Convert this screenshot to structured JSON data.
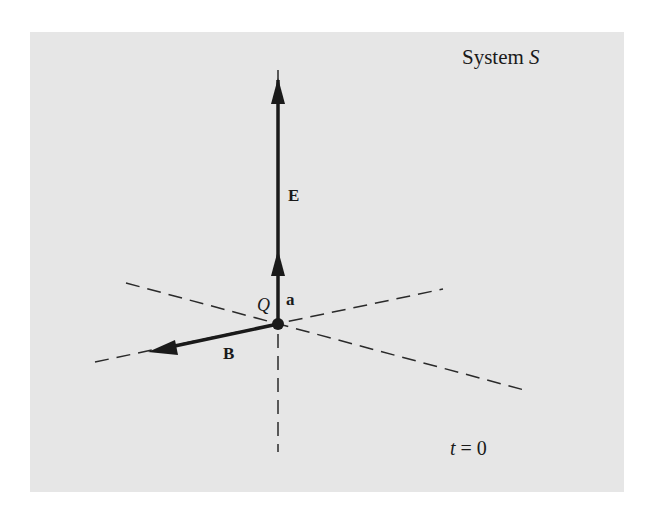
{
  "figure": {
    "title_prefix": "System",
    "title_symbol": "S",
    "time_variable": "t",
    "time_equals": " = 0",
    "point_label": "Q",
    "vectors": {
      "E": {
        "label": "E"
      },
      "a": {
        "label": "a"
      },
      "B": {
        "label": "B"
      }
    },
    "colors": {
      "background": "#e6e6e6",
      "ink": "#1a1a1a"
    }
  }
}
